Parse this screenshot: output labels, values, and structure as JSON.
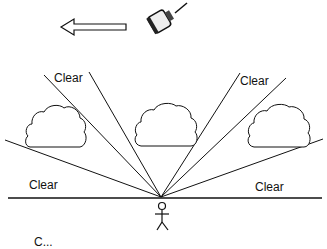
{
  "diagram": {
    "labels": {
      "upper_left": "Clear",
      "upper_right": "Clear",
      "lower_left": "Clear",
      "lower_right": "Clear",
      "bottom_partial": "C..."
    },
    "icons": {
      "arrow": "left-arrow-icon",
      "satellite": "satellite-icon",
      "observer": "stick-figure-icon",
      "clouds": [
        "cloud-icon",
        "cloud-icon",
        "cloud-icon"
      ]
    },
    "colors": {
      "line": "#111111",
      "background": "#ffffff"
    }
  }
}
